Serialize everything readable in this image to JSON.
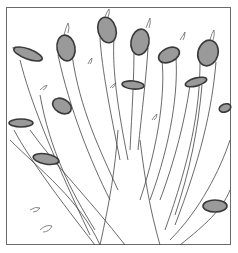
{
  "illustration": {
    "subject": "pruned tree branches with cut ends",
    "style": "black-and-white pen line drawing",
    "cut_fill_color": "#9a9a9a",
    "cut_stroke_color": "#3a3a3a",
    "line_color": "#444444",
    "frame_color": "#6b6b6b",
    "cuts": [
      {
        "cx": 28,
        "cy": 54,
        "rx": 15,
        "ry": 5,
        "rot": 20
      },
      {
        "cx": 66,
        "cy": 48,
        "rx": 9,
        "ry": 13,
        "rot": -10
      },
      {
        "cx": 107,
        "cy": 30,
        "rx": 9,
        "ry": 13,
        "rot": -15
      },
      {
        "cx": 62,
        "cy": 106,
        "rx": 10,
        "ry": 7,
        "rot": 30
      },
      {
        "cx": 140,
        "cy": 42,
        "rx": 9,
        "ry": 13,
        "rot": 10
      },
      {
        "cx": 169,
        "cy": 55,
        "rx": 11,
        "ry": 7,
        "rot": -25
      },
      {
        "cx": 208,
        "cy": 53,
        "rx": 10,
        "ry": 13,
        "rot": 15
      },
      {
        "cx": 133,
        "cy": 85,
        "rx": 11,
        "ry": 4,
        "rot": 5
      },
      {
        "cx": 196,
        "cy": 82,
        "rx": 11,
        "ry": 4,
        "rot": -15
      },
      {
        "cx": 21,
        "cy": 123,
        "rx": 12,
        "ry": 4,
        "rot": 0
      },
      {
        "cx": 46,
        "cy": 159,
        "rx": 13,
        "ry": 5,
        "rot": 10
      },
      {
        "cx": 215,
        "cy": 206,
        "rx": 12,
        "ry": 6,
        "rot": 0
      },
      {
        "cx": 225,
        "cy": 108,
        "rx": 6,
        "ry": 4,
        "rot": -20
      }
    ]
  }
}
